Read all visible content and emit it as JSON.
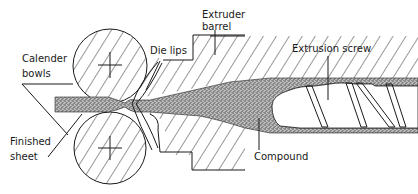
{
  "diagram": {
    "labels": {
      "calender_bowls_line1": "Calender",
      "calender_bowls_line2": "bowls",
      "die_lips": "Die lips",
      "extruder_barrel_line1": "Extruder",
      "extruder_barrel_line2": "barrel",
      "extrusion_screw": "Extrusion screw",
      "finished_sheet_line1": "Finished",
      "finished_sheet_line2": "sheet",
      "compound": "Compound"
    },
    "components": [
      {
        "id": "top-calender-bowl",
        "type": "roll",
        "hatched": true
      },
      {
        "id": "bottom-calender-bowl",
        "type": "roll",
        "hatched": true
      },
      {
        "id": "die-lips",
        "type": "die"
      },
      {
        "id": "extruder-barrel",
        "type": "housing",
        "hatched": true
      },
      {
        "id": "extrusion-screw",
        "type": "screw"
      },
      {
        "id": "compound",
        "type": "material",
        "fill": "stippled"
      },
      {
        "id": "finished-sheet",
        "type": "material",
        "fill": "stippled"
      }
    ],
    "colors": {
      "ink": "#1a1a1a",
      "background": "#ffffff",
      "stipple": "#555555"
    }
  }
}
